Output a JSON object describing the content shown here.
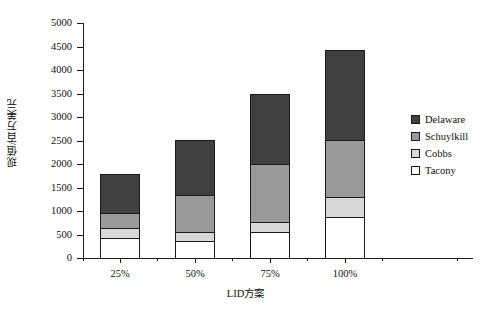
{
  "chart_data": {
    "type": "bar",
    "stacked": true,
    "title": "",
    "xlabel": "LID方案",
    "ylabel": "现值/百万美元",
    "categories": [
      "25%",
      "50%",
      "75%",
      "100%"
    ],
    "series": [
      {
        "name": "Tacony",
        "color": "#ffffff",
        "values": [
          425,
          360,
          555,
          870
        ]
      },
      {
        "name": "Cobbs",
        "color": "#d8d8d8",
        "values": [
          210,
          190,
          210,
          430
        ]
      },
      {
        "name": "Schuylkill",
        "color": "#999999",
        "values": [
          320,
          790,
          1235,
          1210
        ]
      },
      {
        "name": "Delaware",
        "color": "#404040",
        "values": [
          830,
          1170,
          1490,
          1915
        ]
      }
    ],
    "totals": [
      1930,
      2650,
      3570,
      4500
    ],
    "ylim": [
      0,
      5000
    ],
    "ytick_labels": [
      "0",
      "500",
      "1000",
      "1500",
      "2000",
      "2500",
      "3000",
      "3500",
      "4000",
      "4500",
      "5000"
    ],
    "ytick_values": [
      0,
      500,
      1000,
      1500,
      2000,
      2500,
      3000,
      3500,
      4000,
      4500,
      5000
    ],
    "grid": false,
    "legend_position": "right",
    "legend_order": [
      "Delaware",
      "Schuylkill",
      "Cobbs",
      "Tacony"
    ]
  },
  "legend": {
    "items": [
      {
        "label": "Delaware",
        "color": "#404040"
      },
      {
        "label": "Schuylkill",
        "color": "#999999"
      },
      {
        "label": "Cobbs",
        "color": "#d8d8d8"
      },
      {
        "label": "Tacony",
        "color": "#ffffff"
      }
    ]
  },
  "axes": {
    "y_title": "现值/百万美元",
    "x_title": "LID方案"
  }
}
